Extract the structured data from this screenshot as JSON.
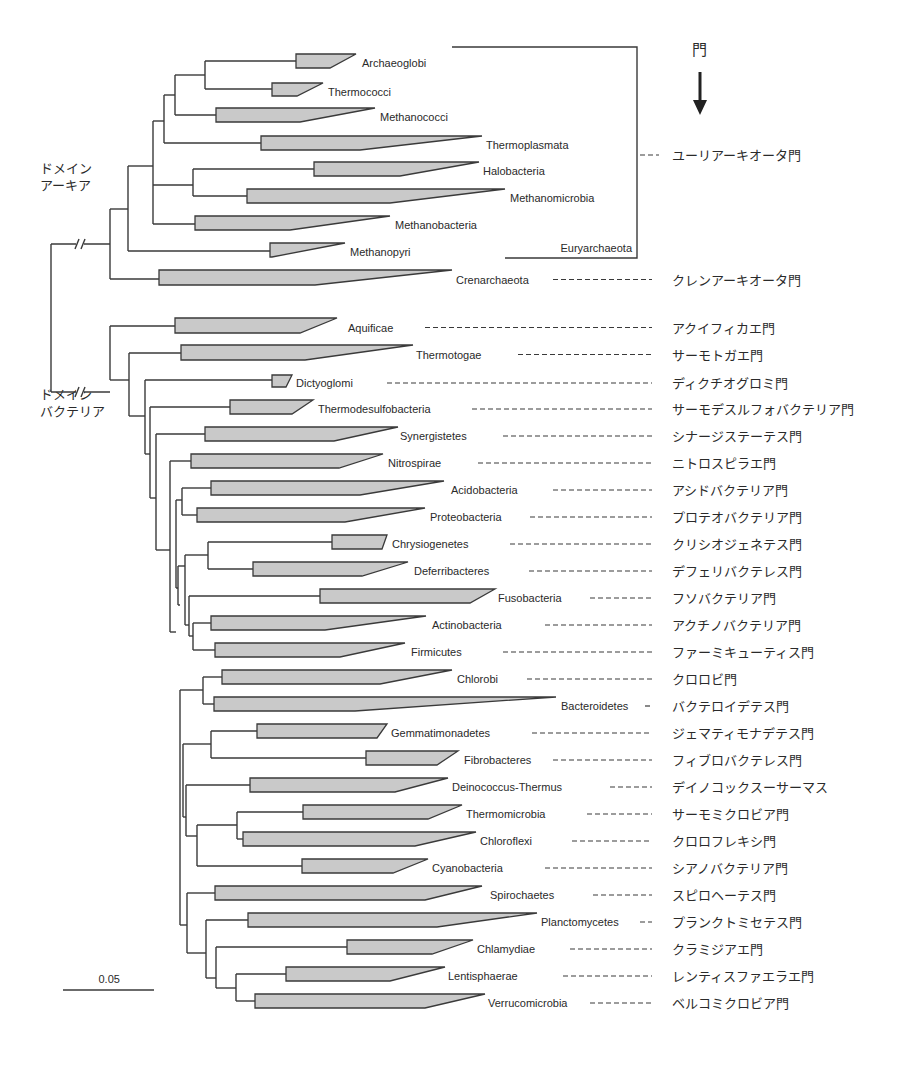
{
  "figure": {
    "header": "門",
    "arrow": "down-arrow",
    "domains": [
      {
        "id": "archaea",
        "line1": "ドメイン",
        "line2": "アーキア",
        "x": 40,
        "y": 160
      },
      {
        "id": "bacteria",
        "line1": "ドメイン",
        "line2": "バクテリア",
        "x": 40,
        "y": 386
      }
    ],
    "bracket": {
      "label": "Euryarchaeota",
      "phylum_jp": "ユーリアーキオータ門",
      "x": 637,
      "y_top": 47,
      "y_bottom": 258,
      "x_left_top": 452,
      "x_left_bottom": 505
    },
    "scale_bar": {
      "label": "0.05",
      "x1": 63,
      "x2": 154,
      "y": 990
    },
    "jp_x": 672,
    "clades": [
      {
        "name": "Archaeoglobi",
        "x0": 296,
        "xt": 356,
        "xb": 330,
        "y0": 54,
        "y1": 68,
        "lx": 362,
        "dash": null,
        "jp": null
      },
      {
        "name": "Thermococci",
        "x0": 272,
        "xt": 323,
        "xb": 297,
        "y0": 83,
        "y1": 96,
        "lx": 328,
        "dash": null,
        "jp": null
      },
      {
        "name": "Methanococci",
        "x0": 216,
        "xt": 375,
        "xb": 300,
        "y0": 108,
        "y1": 122,
        "lx": 380,
        "dash": null,
        "jp": null
      },
      {
        "name": "Thermoplasmata",
        "x0": 261,
        "xt": 482,
        "xb": 360,
        "y0": 136,
        "y1": 150,
        "lx": 486,
        "dash": null,
        "jp": null
      },
      {
        "name": "Halobacteria",
        "x0": 314,
        "xt": 479,
        "xb": 400,
        "y0": 162,
        "y1": 176,
        "lx": 483,
        "dash": null,
        "jp": null
      },
      {
        "name": "Methanomicrobia",
        "x0": 247,
        "xt": 505,
        "xb": 390,
        "y0": 189,
        "y1": 203,
        "lx": 510,
        "dash": null,
        "jp": null
      },
      {
        "name": "Methanobacteria",
        "x0": 195,
        "xt": 390,
        "xb": 290,
        "y0": 216,
        "y1": 230,
        "lx": 395,
        "dash": null,
        "jp": null
      },
      {
        "name": "Methanopyri",
        "x0": 270,
        "xt": 345,
        "xb": 272,
        "y0": 243,
        "y1": 257,
        "lx": 350,
        "dash": null,
        "jp": null
      },
      {
        "name": "Crenarchaeota",
        "x0": 159,
        "xt": 452,
        "xb": 315,
        "y0": 270,
        "y1": 285,
        "lx": 456,
        "dash": [
          553,
          652
        ],
        "jp": "クレンアーキオータ門"
      },
      {
        "name": "Aquificae",
        "x0": 175,
        "xt": 337,
        "xb": 300,
        "y0": 318,
        "y1": 333,
        "lx": 348,
        "dash": [
          425,
          652
        ],
        "jp": "アクイフィカエ門"
      },
      {
        "name": "Thermotogae",
        "x0": 181,
        "xt": 413,
        "xb": 305,
        "y0": 345,
        "y1": 360,
        "lx": 416,
        "dash": [
          518,
          652
        ],
        "jp": "サーモトガエ門"
      },
      {
        "name": "Dictyoglomi",
        "x0": 272,
        "xt": 292,
        "xb": 286,
        "y0": 375,
        "y1": 387,
        "lx": 296,
        "dash": [
          387,
          652
        ],
        "jp": "ディクチオグロミ門"
      },
      {
        "name": "Thermodesulfobacteria",
        "x0": 230,
        "xt": 313,
        "xb": 292,
        "y0": 400,
        "y1": 414,
        "lx": 318,
        "dash": [
          472,
          652
        ],
        "jp": "サーモデスルフォバクテリア門"
      },
      {
        "name": "Synergistetes",
        "x0": 205,
        "xt": 398,
        "xb": 334,
        "y0": 427,
        "y1": 441,
        "lx": 400,
        "dash": [
          503,
          652
        ],
        "jp": "シナージステーテス門"
      },
      {
        "name": "Nitrospirae",
        "x0": 191,
        "xt": 383,
        "xb": 339,
        "y0": 454,
        "y1": 468,
        "lx": 388,
        "dash": [
          478,
          652
        ],
        "jp": "ニトロスピラエ門"
      },
      {
        "name": "Acidobacteria",
        "x0": 211,
        "xt": 444,
        "xb": 360,
        "y0": 481,
        "y1": 495,
        "lx": 451,
        "dash": [
          553,
          652
        ],
        "jp": "アシドバクテリア門"
      },
      {
        "name": "Proteobacteria",
        "x0": 197,
        "xt": 425,
        "xb": 345,
        "y0": 508,
        "y1": 522,
        "lx": 430,
        "dash": [
          530,
          652
        ],
        "jp": "プロテオバクテリア門"
      },
      {
        "name": "Chrysiogenetes",
        "x0": 332,
        "xt": 387,
        "xb": 382,
        "y0": 535,
        "y1": 549,
        "lx": 392,
        "dash": [
          510,
          652
        ],
        "jp": "クリシオジェネテス門"
      },
      {
        "name": "Deferribacteres",
        "x0": 253,
        "xt": 408,
        "xb": 362,
        "y0": 562,
        "y1": 576,
        "lx": 414,
        "dash": [
          529,
          652
        ],
        "jp": "デフェリバクテレス門"
      },
      {
        "name": "Fusobacteria",
        "x0": 320,
        "xt": 495,
        "xb": 470,
        "y0": 589,
        "y1": 603,
        "lx": 498,
        "dash": [
          590,
          652
        ],
        "jp": "フソバクテリア門"
      },
      {
        "name": "Actinobacteria",
        "x0": 211,
        "xt": 426,
        "xb": 325,
        "y0": 616,
        "y1": 630,
        "lx": 432,
        "dash": [
          545,
          652
        ],
        "jp": "アクチノバクテリア門"
      },
      {
        "name": "Firmicutes",
        "x0": 215,
        "xt": 405,
        "xb": 340,
        "y0": 643,
        "y1": 657,
        "lx": 411,
        "dash": [
          503,
          652
        ],
        "jp": "ファーミキューティス門"
      },
      {
        "name": "Chlorobi",
        "x0": 222,
        "xt": 452,
        "xb": 380,
        "y0": 670,
        "y1": 684,
        "lx": 457,
        "dash": [
          527,
          652
        ],
        "jp": "クロロビ門"
      },
      {
        "name": "Bacteroidetes",
        "x0": 214,
        "xt": 556,
        "xb": 355,
        "y0": 697,
        "y1": 711,
        "lx": 561,
        "dash": [
          645,
          652
        ],
        "jp": "バクテロイデテス門"
      },
      {
        "name": "Gemmatimonadetes",
        "x0": 257,
        "xt": 387,
        "xb": 377,
        "y0": 724,
        "y1": 738,
        "lx": 391,
        "dash": [
          532,
          652
        ],
        "jp": "ジェマティモナデテス門"
      },
      {
        "name": "Fibrobacteres",
        "x0": 366,
        "xt": 458,
        "xb": 437,
        "y0": 751,
        "y1": 765,
        "lx": 464,
        "dash": [
          553,
          652
        ],
        "jp": "フィブロバクテレス門"
      },
      {
        "name": "Deinococcus-Thermus",
        "x0": 250,
        "xt": 448,
        "xb": 395,
        "y0": 778,
        "y1": 792,
        "lx": 452,
        "dash": [
          610,
          652
        ],
        "jp": "デイノコックスーサーマス"
      },
      {
        "name": "Thermomicrobia",
        "x0": 303,
        "xt": 462,
        "xb": 428,
        "y0": 805,
        "y1": 819,
        "lx": 466,
        "dash": [
          587,
          652
        ],
        "jp": "サーモミクロビア門"
      },
      {
        "name": "Chloroflexi",
        "x0": 243,
        "xt": 476,
        "xb": 415,
        "y0": 832,
        "y1": 846,
        "lx": 480,
        "dash": [
          572,
          652
        ],
        "jp": "クロロフレキシ門"
      },
      {
        "name": "Cyanobacteria",
        "x0": 302,
        "xt": 428,
        "xb": 393,
        "y0": 859,
        "y1": 873,
        "lx": 432,
        "dash": [
          545,
          652
        ],
        "jp": "シアノバクテリア門"
      },
      {
        "name": "Spirochaetes",
        "x0": 215,
        "xt": 482,
        "xb": 425,
        "y0": 886,
        "y1": 900,
        "lx": 490,
        "dash": [
          593,
          652
        ],
        "jp": "スピロヘーテス門"
      },
      {
        "name": "Planctomycetes",
        "x0": 248,
        "xt": 537,
        "xb": 437,
        "y0": 913,
        "y1": 927,
        "lx": 541,
        "dash": [
          640,
          652
        ],
        "jp": "プランクトミセテス門"
      },
      {
        "name": "Chlamydiae",
        "x0": 347,
        "xt": 473,
        "xb": 432,
        "y0": 940,
        "y1": 954,
        "lx": 477,
        "dash": [
          570,
          652
        ],
        "jp": "クラミジアエ門"
      },
      {
        "name": "Lentisphaerae",
        "x0": 286,
        "xt": 445,
        "xb": 390,
        "y0": 967,
        "y1": 981,
        "lx": 448,
        "dash": [
          563,
          652
        ],
        "jp": "レンティスファエラエ門"
      },
      {
        "name": "Verrucomicrobia",
        "x0": 255,
        "xt": 485,
        "xb": 425,
        "y0": 994,
        "y1": 1008,
        "lx": 488,
        "dash": [
          590,
          652
        ],
        "jp": "ベルコミクロビア門"
      }
    ],
    "branches": [
      [
        51,
        244,
        51,
        392
      ],
      [
        51,
        244,
        110,
        244
      ],
      [
        51,
        392,
        110,
        392
      ],
      [
        110,
        209,
        110,
        279
      ],
      [
        110,
        209,
        128,
        209
      ],
      [
        110,
        279,
        159,
        279
      ],
      [
        128,
        166,
        128,
        251
      ],
      [
        128,
        166,
        153,
        166
      ],
      [
        128,
        251,
        270,
        251
      ],
      [
        153,
        121,
        153,
        224
      ],
      [
        153,
        121,
        164,
        121
      ],
      [
        153,
        185,
        193,
        185
      ],
      [
        153,
        224,
        195,
        224
      ],
      [
        164,
        95,
        164,
        143
      ],
      [
        164,
        95,
        175,
        95
      ],
      [
        164,
        143,
        261,
        143
      ],
      [
        175,
        75,
        175,
        115
      ],
      [
        175,
        75,
        205,
        75
      ],
      [
        175,
        115,
        216,
        115
      ],
      [
        205,
        61,
        205,
        89
      ],
      [
        205,
        61,
        296,
        61
      ],
      [
        205,
        89,
        272,
        89
      ],
      [
        193,
        169,
        193,
        196
      ],
      [
        193,
        169,
        314,
        169
      ],
      [
        193,
        196,
        247,
        196
      ],
      [
        110,
        326,
        110,
        380
      ],
      [
        110,
        326,
        175,
        326
      ],
      [
        110,
        380,
        129,
        380
      ],
      [
        129,
        353,
        129,
        416
      ],
      [
        129,
        353,
        181,
        353
      ],
      [
        129,
        416,
        145,
        416
      ],
      [
        145,
        380,
        145,
        454
      ],
      [
        145,
        380,
        272,
        380
      ],
      [
        145,
        454,
        150,
        454
      ],
      [
        150,
        407,
        150,
        498
      ],
      [
        150,
        407,
        230,
        407
      ],
      [
        150,
        498,
        156,
        498
      ],
      [
        156,
        434,
        156,
        550
      ],
      [
        156,
        434,
        205,
        434
      ],
      [
        156,
        550,
        170,
        550
      ],
      [
        170,
        461,
        170,
        632
      ],
      [
        170,
        461,
        191,
        461
      ],
      [
        170,
        632,
        176,
        632
      ],
      [
        176,
        500,
        176,
        588
      ],
      [
        176,
        500,
        182,
        500
      ],
      [
        182,
        488,
        182,
        515
      ],
      [
        182,
        488,
        211,
        488
      ],
      [
        182,
        515,
        197,
        515
      ],
      [
        176,
        588,
        178,
        588
      ],
      [
        178,
        566,
        178,
        605
      ],
      [
        178,
        566,
        185,
        566
      ],
      [
        185,
        555,
        185,
        625
      ],
      [
        185,
        555,
        208,
        555
      ],
      [
        208,
        542,
        208,
        569
      ],
      [
        208,
        542,
        332,
        542
      ],
      [
        208,
        569,
        253,
        569
      ],
      [
        185,
        625,
        189,
        625
      ],
      [
        189,
        596,
        189,
        636
      ],
      [
        189,
        596,
        320,
        596
      ],
      [
        189,
        636,
        193,
        636
      ],
      [
        193,
        623,
        193,
        650
      ],
      [
        193,
        623,
        211,
        623
      ],
      [
        193,
        650,
        215,
        650
      ],
      [
        178,
        605,
        180,
        605
      ],
      [
        180,
        690,
        180,
        925
      ],
      [
        180,
        690,
        203,
        690
      ],
      [
        203,
        677,
        203,
        704
      ],
      [
        203,
        677,
        222,
        677
      ],
      [
        203,
        704,
        214,
        704
      ],
      [
        180,
        925,
        183,
        925
      ],
      [
        183,
        744,
        183,
        817
      ],
      [
        183,
        744,
        211,
        744
      ],
      [
        211,
        731,
        211,
        758
      ],
      [
        211,
        731,
        257,
        731
      ],
      [
        211,
        758,
        366,
        758
      ],
      [
        183,
        817,
        186,
        817
      ],
      [
        186,
        785,
        186,
        836
      ],
      [
        186,
        785,
        250,
        785
      ],
      [
        186,
        836,
        197,
        836
      ],
      [
        197,
        825,
        197,
        866
      ],
      [
        197,
        825,
        237,
        825
      ],
      [
        237,
        812,
        237,
        839
      ],
      [
        237,
        812,
        303,
        812
      ],
      [
        237,
        839,
        243,
        839
      ],
      [
        197,
        866,
        302,
        866
      ],
      [
        183,
        925,
        187,
        925
      ],
      [
        187,
        893,
        187,
        953
      ],
      [
        187,
        893,
        215,
        893
      ],
      [
        187,
        953,
        206,
        953
      ],
      [
        206,
        920,
        206,
        978
      ],
      [
        206,
        920,
        248,
        920
      ],
      [
        206,
        978,
        216,
        978
      ],
      [
        216,
        947,
        216,
        988
      ],
      [
        216,
        947,
        347,
        947
      ],
      [
        216,
        988,
        236,
        988
      ],
      [
        236,
        974,
        236,
        1001
      ],
      [
        236,
        974,
        286,
        974
      ],
      [
        236,
        1001,
        255,
        1001
      ]
    ],
    "breaks": [
      {
        "x": 80,
        "y": 244
      },
      {
        "x": 80,
        "y": 392
      }
    ]
  }
}
